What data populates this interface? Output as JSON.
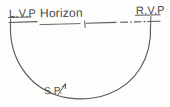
{
  "diagram": {
    "background_color": "#fdfdfb",
    "ink_color": "#4a4a4a",
    "labels": {
      "left_vanishing_point": "L.V.P",
      "horizon": "Horizon",
      "right_vanishing_point": "R.V.P",
      "station_point": "S.P."
    },
    "elements": {
      "horizon_line_style": "dash-dot",
      "arc_shape": "semicircle",
      "arrow": "sp-arrow-icon",
      "tick_mark": "horizon-tick-icon",
      "underline_lvp": true,
      "underline_rvp": true
    }
  }
}
